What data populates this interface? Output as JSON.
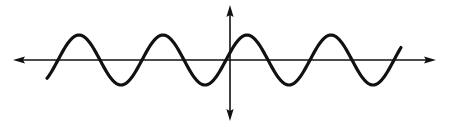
{
  "figure": {
    "width": 449,
    "height": 127,
    "colors": {
      "background": "#ffffff",
      "ink": "#111111"
    },
    "axes": {
      "origin": [
        230,
        60
      ],
      "x_axis": {
        "from": 13,
        "to": 436,
        "arrows": "both"
      },
      "y_axis": {
        "from": 5,
        "to": 121,
        "arrows": "both"
      },
      "stroke_width": 1.6
    },
    "wave": {
      "type": "sine",
      "midline_y": 60,
      "amplitude": 25,
      "period": 84,
      "first_rising_zero_x": 58,
      "x_start": 47,
      "x_end": 401,
      "stroke_width": 3.2
    }
  }
}
